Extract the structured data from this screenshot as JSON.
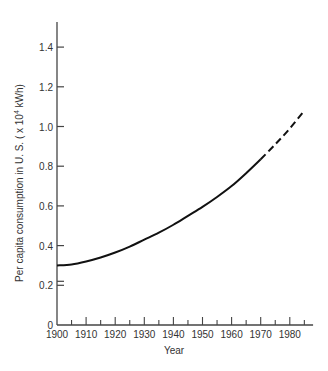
{
  "chart_data": {
    "type": "line",
    "title": "",
    "xlabel": "Year",
    "ylabel": "Per capita consumption in U.S. (x 10^4 kWh)",
    "ylabel_parts": {
      "main": "Per capita consumption in U. S. ( x 10",
      "sup": "4",
      "tail": " kWh)"
    },
    "xlim": [
      1900,
      1988
    ],
    "ylim": [
      0,
      1.5
    ],
    "x_ticks": [
      1900,
      1910,
      1920,
      1930,
      1940,
      1950,
      1960,
      1970,
      1980
    ],
    "x_tick_labels": [
      "1900",
      "1910",
      "1920",
      "1930",
      "1940",
      "1950",
      "1960",
      "1970",
      "1980"
    ],
    "y_ticks": [
      0,
      0.2,
      0.4,
      0.6,
      0.8,
      1.0,
      1.2,
      1.4
    ],
    "y_tick_labels": [
      "0",
      "0.2",
      "0.4",
      "0.6",
      "0.8",
      "1.0",
      "1.2",
      "1.4"
    ],
    "axis_break": "double tick at 0.2 on y-axis",
    "grid": false,
    "legend": null,
    "series": [
      {
        "name": "Historical (solid)",
        "style": "solid",
        "x": [
          1900,
          1905,
          1910,
          1915,
          1920,
          1925,
          1930,
          1935,
          1940,
          1945,
          1950,
          1955,
          1960,
          1965,
          1970
        ],
        "values": [
          0.3,
          0.305,
          0.32,
          0.34,
          0.365,
          0.395,
          0.43,
          0.465,
          0.505,
          0.55,
          0.595,
          0.645,
          0.7,
          0.765,
          0.835
        ]
      },
      {
        "name": "Projected (dashed)",
        "style": "dashed",
        "x": [
          1970,
          1975,
          1980,
          1985
        ],
        "values": [
          0.835,
          0.91,
          0.99,
          1.08
        ]
      }
    ]
  },
  "colors": {
    "line": "#111111",
    "axis": "#444444",
    "text": "#333333",
    "background": "#ffffff"
  }
}
